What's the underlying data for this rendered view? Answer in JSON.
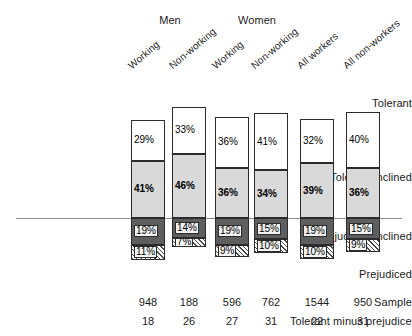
{
  "chart_data": {
    "type": "bar",
    "title": "",
    "subtitle": "",
    "xlabel": "",
    "ylabel": "",
    "stacked": true,
    "baseline_note": "Bars are stacked and aligned on a zero reference line between Tolerant-inclined and Prejudiced-inclined",
    "grid": false,
    "legend_position": "row-labels-left",
    "categories": [
      "Working",
      "Non-working",
      "Working",
      "Non-working",
      "All workers",
      "All non-workers"
    ],
    "group_headers": [
      "Men",
      "Women"
    ],
    "series": [
      {
        "name": "Tolerant",
        "values": [
          29,
          33,
          36,
          41,
          32,
          40
        ],
        "fill": "#ffffff",
        "pattern": "solid"
      },
      {
        "name": "Tolerant-inclined",
        "values": [
          41,
          46,
          36,
          34,
          39,
          36
        ],
        "fill": "#d9d9d9",
        "pattern": "solid"
      },
      {
        "name": "Prejudiced-inclined",
        "values": [
          19,
          14,
          19,
          15,
          19,
          15
        ],
        "fill": "#5e5e5e",
        "pattern": "solid"
      },
      {
        "name": "Prejudiced",
        "values": [
          11,
          7,
          9,
          10,
          10,
          9
        ],
        "fill": "#ffffff",
        "pattern": "diagonal-hatch"
      }
    ],
    "value_labels": {
      "Tolerant": [
        "29%",
        "33%",
        "36%",
        "41%",
        "32%",
        "40%"
      ],
      "Tolerant-inclined": [
        "41%",
        "46%",
        "36%",
        "34%",
        "39%",
        "36%"
      ],
      "Prejudiced-inclined": [
        "19%",
        "14%",
        "19%",
        "15%",
        "19%",
        "15%"
      ],
      "Prejudiced": [
        "11%",
        "7%",
        "9%",
        "10%",
        "10%",
        "9%"
      ]
    },
    "footer_rows": [
      {
        "label": "Sample",
        "values": [
          "948",
          "188",
          "596",
          "762",
          "1544",
          "950"
        ]
      },
      {
        "label": "Tolerant minus prejudiced",
        "values": [
          "18",
          "26",
          "27",
          "31",
          "22",
          "31"
        ]
      }
    ],
    "colors": {
      "tolerant": "#ffffff",
      "tolerant_inclined": "#d9d9d9",
      "prejudiced_inclined": "#5e5e5e",
      "prejudiced": "#ffffff",
      "outline": "#2b2b2b",
      "zero_line": "#8a8a8a"
    }
  }
}
